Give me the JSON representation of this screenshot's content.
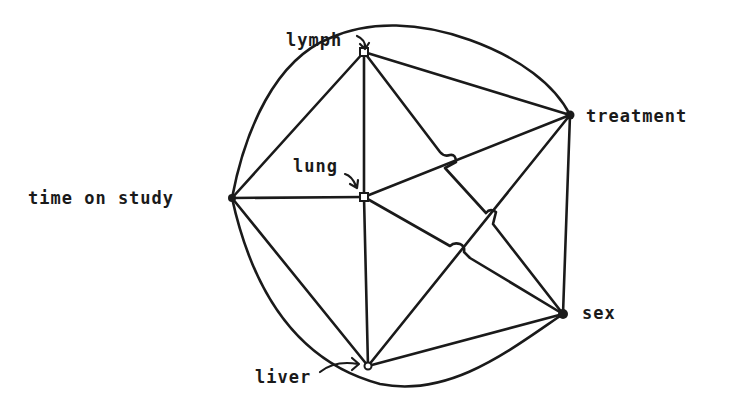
{
  "diagram": {
    "type": "undirected graph",
    "nodes": [
      {
        "id": "lymph",
        "label": "lymph",
        "x": 364,
        "y": 52,
        "marker": "open"
      },
      {
        "id": "treatment",
        "label": "treatment",
        "x": 570,
        "y": 115,
        "marker": "filled"
      },
      {
        "id": "time",
        "label": "time on study",
        "x": 232,
        "y": 198,
        "marker": "filled"
      },
      {
        "id": "lung",
        "label": "lung",
        "x": 364,
        "y": 197,
        "marker": "open"
      },
      {
        "id": "sex",
        "label": "sex",
        "x": 563,
        "y": 314,
        "marker": "filled"
      },
      {
        "id": "liver",
        "label": "liver",
        "x": 368,
        "y": 366,
        "marker": "open"
      }
    ],
    "edges": [
      [
        "lymph",
        "time"
      ],
      [
        "lymph",
        "lung"
      ],
      [
        "lymph",
        "treatment"
      ],
      [
        "lymph",
        "sex"
      ],
      [
        "time",
        "lung"
      ],
      [
        "time",
        "liver"
      ],
      [
        "time",
        "treatment"
      ],
      [
        "time",
        "sex"
      ],
      [
        "lung",
        "treatment"
      ],
      [
        "lung",
        "sex"
      ],
      [
        "lung",
        "liver"
      ],
      [
        "treatment",
        "sex"
      ],
      [
        "treatment",
        "liver"
      ],
      [
        "liver",
        "sex"
      ]
    ]
  },
  "labels": {
    "lymph": "lymph",
    "treatment": "treatment",
    "time": "time on study",
    "lung": "lung",
    "sex": "sex",
    "liver": "liver"
  }
}
